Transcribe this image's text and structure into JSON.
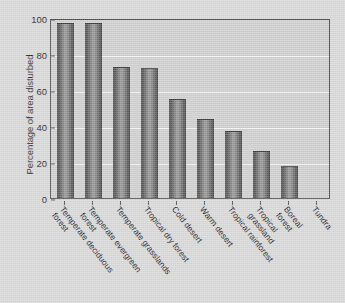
{
  "chart_data": {
    "type": "bar",
    "title": "",
    "xlabel": "",
    "ylabel": "Percentage of area disturbed",
    "ylim": [
      0,
      100
    ],
    "yticks": [
      0,
      20,
      40,
      60,
      80,
      100
    ],
    "grid": true,
    "legend": "none",
    "categories": [
      "Temperate deciduous\nforest",
      "Temperate evergreen\nforest",
      "Temperate grasslands",
      "Tropical dry forest",
      "Cold desert",
      "Warm desert",
      "Tropical rainforest",
      "Tropical grassland",
      "Boreal forest",
      "Tundra"
    ],
    "values": [
      97,
      97,
      73,
      72,
      55,
      44,
      37,
      26,
      18,
      0
    ],
    "bar_color": "#6e6e6e",
    "plot_background": "#cfcfcf",
    "gridline_color": "#f2f2f2",
    "axis_color": "#4a4a4a"
  },
  "figure": {
    "background": "#d8d8d8"
  }
}
